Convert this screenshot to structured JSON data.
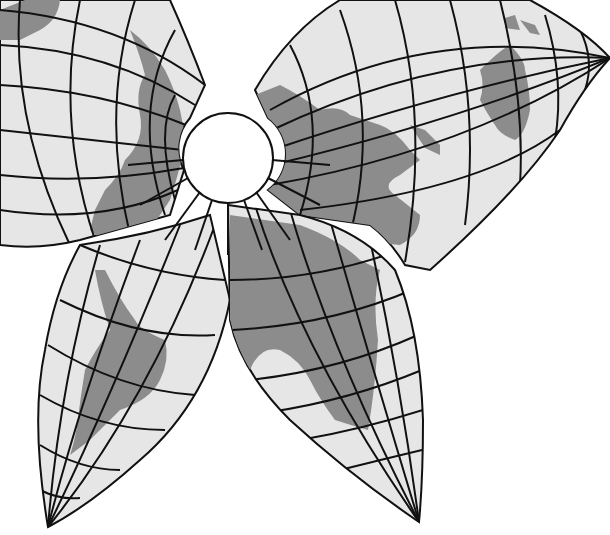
{
  "map": {
    "type": "butterfly world map projection",
    "colors": {
      "background": "#ffffff",
      "sea": "#e6e6e6",
      "land": "#8c8c8c",
      "graticule": "#111111"
    },
    "center_hole": {
      "cx": 228,
      "cy": 158,
      "r": 45
    },
    "lobes": [
      {
        "id": "north-america-lobe",
        "label": "North America"
      },
      {
        "id": "asia-australia-lobe",
        "label": "Asia / Australia"
      },
      {
        "id": "south-america-lobe",
        "label": "South America"
      },
      {
        "id": "africa-europe-lobe",
        "label": "Africa / Europe"
      }
    ],
    "lobe_tips": {
      "right": [
        610,
        58
      ],
      "bottom_left": [
        48,
        527
      ],
      "bottom_right": [
        419,
        522
      ]
    }
  }
}
